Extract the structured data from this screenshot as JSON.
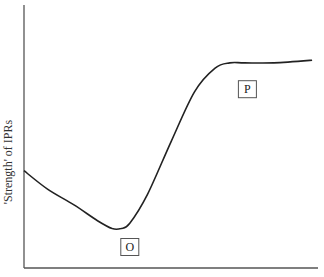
{
  "chart_data": {
    "type": "line",
    "title": "",
    "xlabel": "",
    "ylabel": "'Strength' of IPRs",
    "xlim": [
      0,
      100
    ],
    "ylim": [
      0,
      100
    ],
    "grid": false,
    "legend": "none",
    "series": [
      {
        "name": "IPR strength curve",
        "x": [
          0,
          8,
          17,
          25,
          30,
          33,
          36,
          42,
          50,
          58,
          65,
          70,
          75,
          85,
          98
        ],
        "y": [
          37,
          30,
          24,
          18,
          15,
          15,
          17,
          28,
          48,
          67,
          76,
          78,
          78,
          78,
          79
        ]
      }
    ],
    "annotations": [
      {
        "label": "O",
        "x": 36,
        "y": 8,
        "meaning": "minimum point"
      },
      {
        "label": "P",
        "x": 76,
        "y": 68,
        "meaning": "plateau point"
      }
    ]
  }
}
